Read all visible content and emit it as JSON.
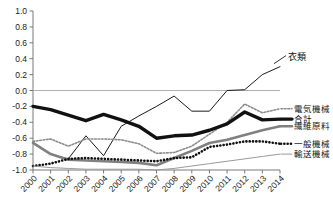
{
  "chart_data": {
    "type": "line",
    "title": "",
    "xlabel": "",
    "ylabel": "",
    "x": [
      2000,
      2001,
      2002,
      2003,
      2004,
      2005,
      2006,
      2007,
      2008,
      2009,
      2010,
      2011,
      2012,
      2013,
      2014
    ],
    "xtick_labels": [
      "2000",
      "2001",
      "2002",
      "2003",
      "2004",
      "2005",
      "2006",
      "2007",
      "2008",
      "2009",
      "2010",
      "2011",
      "2012",
      "2013",
      "2014"
    ],
    "ytick_labels": [
      "1.0",
      "0.8",
      "0.6",
      "0.4",
      "0.2",
      "0.0",
      "-0.2",
      "-0.4",
      "-0.6",
      "-0.8",
      "-1.0"
    ],
    "ytick_values": [
      1.0,
      0.8,
      0.6,
      0.4,
      0.2,
      0.0,
      -0.2,
      -0.4,
      -0.6,
      -0.8,
      -1.0
    ],
    "ylim": [
      -1.0,
      1.0
    ],
    "grid": false,
    "zero_line": true,
    "legend_position": "right",
    "series": [
      {
        "name": "衣類",
        "label_kind": "annotation",
        "style": "thin-solid",
        "color": "#1a1a1a",
        "width": 1.0,
        "values": [
          -0.65,
          -0.8,
          -0.86,
          -0.57,
          -0.82,
          -0.45,
          -0.32,
          -0.2,
          -0.07,
          -0.26,
          -0.26,
          0.0,
          0.01,
          0.2,
          0.3
        ]
      },
      {
        "name": "電気機械",
        "label_kind": "legend",
        "style": "fine-dotted",
        "color": "#8c8c8c",
        "width": 1.6,
        "values": [
          -0.64,
          -0.61,
          -0.7,
          -0.61,
          -0.61,
          -0.62,
          -0.67,
          -0.79,
          -0.78,
          -0.7,
          -0.55,
          -0.4,
          -0.17,
          -0.28,
          -0.23
        ]
      },
      {
        "name": "合計",
        "label_kind": "legend",
        "style": "thick-solid",
        "color": "#111111",
        "width": 3.4,
        "values": [
          -0.2,
          -0.24,
          -0.31,
          -0.38,
          -0.3,
          -0.37,
          -0.45,
          -0.6,
          -0.57,
          -0.56,
          -0.5,
          -0.42,
          -0.27,
          -0.37,
          -0.36
        ]
      },
      {
        "name": "繊維原料",
        "label_kind": "legend",
        "style": "medium-solid-gray",
        "color": "#808080",
        "width": 2.6,
        "values": [
          -0.66,
          -0.8,
          -0.87,
          -0.88,
          -0.89,
          -0.9,
          -0.91,
          -0.94,
          -0.85,
          -0.76,
          -0.66,
          -0.62,
          -0.56,
          -0.5,
          -0.45
        ]
      },
      {
        "name": "一般機械",
        "label_kind": "legend",
        "style": "thick-dotted",
        "color": "#111111",
        "width": 2.6,
        "values": [
          -0.95,
          -0.92,
          -0.86,
          -0.85,
          -0.86,
          -0.87,
          -0.88,
          -0.89,
          -0.85,
          -0.84,
          -0.71,
          -0.68,
          -0.64,
          -0.64,
          -0.67
        ]
      },
      {
        "name": "輸送機械",
        "label_kind": "legend",
        "style": "hairline-solid-gray",
        "color": "#9a9a9a",
        "width": 1.0,
        "values": [
          -0.95,
          -0.97,
          -0.98,
          -0.99,
          -0.99,
          -0.99,
          -0.99,
          -1.0,
          -0.98,
          -0.95,
          -0.92,
          -0.89,
          -0.86,
          -0.83,
          -0.8
        ]
      }
    ]
  },
  "annotations": [
    {
      "text": "衣類"
    }
  ],
  "legend": {
    "items": [
      {
        "label": "電気機械"
      },
      {
        "label": "合計"
      },
      {
        "label": "繊維原料"
      },
      {
        "label": "一般機械"
      },
      {
        "label": "輸送機械"
      }
    ]
  },
  "colors": {
    "axis": "#6b6b6b",
    "zero_line": "#b0b0b0",
    "text": "#1a1a1a",
    "total_line": "#111111",
    "gray_line": "#808080"
  }
}
